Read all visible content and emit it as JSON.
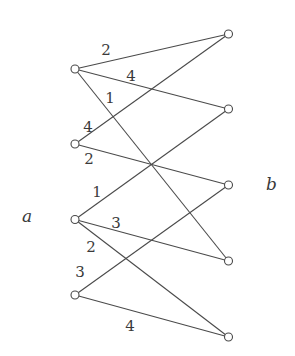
{
  "set_labels": {
    "left": "a",
    "right": "b"
  },
  "left_nodes": [
    "a1",
    "a2",
    "a3",
    "a4"
  ],
  "right_nodes": [
    "b1",
    "b2",
    "b3",
    "b4",
    "b5"
  ],
  "edges": [
    {
      "from": "a1",
      "to": "b1",
      "weight": "2"
    },
    {
      "from": "a1",
      "to": "b2",
      "weight": "4"
    },
    {
      "from": "a1",
      "to": "b4",
      "weight": "1"
    },
    {
      "from": "a2",
      "to": "b1",
      "weight": "4"
    },
    {
      "from": "a2",
      "to": "b3",
      "weight": "2"
    },
    {
      "from": "a3",
      "to": "b2",
      "weight": "1"
    },
    {
      "from": "a3",
      "to": "b4",
      "weight": "3"
    },
    {
      "from": "a3",
      "to": "b5",
      "weight": "2"
    },
    {
      "from": "a4",
      "to": "b3",
      "weight": "3"
    },
    {
      "from": "a4",
      "to": "b5",
      "weight": "4"
    }
  ],
  "colors": {
    "stroke": "#4a4a4a",
    "text": "#3a3a3a",
    "background": "#ffffff"
  }
}
